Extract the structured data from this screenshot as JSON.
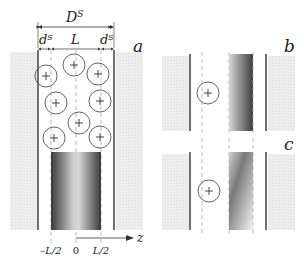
{
  "figure": {
    "panels": [
      {
        "id": "a",
        "label": "a"
      },
      {
        "id": "b",
        "label": "b"
      },
      {
        "id": "c",
        "label": "c"
      }
    ],
    "dimension_labels": {
      "total_width": "D",
      "total_width_sup": "S",
      "left_gap": "d",
      "left_gap_sup": "S",
      "center": "L",
      "right_gap": "d",
      "right_gap_sup": "S"
    },
    "axis": {
      "label": "z",
      "ticks": [
        "–L/2",
        "0",
        "L/2"
      ]
    },
    "particle_symbol": "+",
    "colors": {
      "wall": "#333333",
      "hatch": "#e6e6e6",
      "dashed": "#aaaaaa",
      "circle": "#555555",
      "gradient_dark": "#444444",
      "gradient_light": "#f2f2f2"
    }
  }
}
